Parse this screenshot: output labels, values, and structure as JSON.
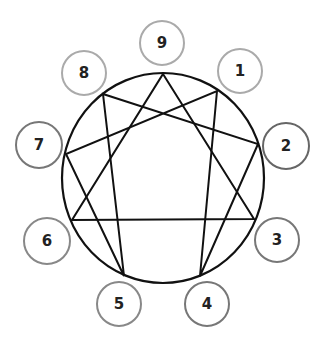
{
  "diagram": {
    "type": "enneagram",
    "main_circle": {
      "cx": 163,
      "cy": 178,
      "rx": 101,
      "ry": 105,
      "stroke": "#111111"
    },
    "nodes": [
      {
        "label": "9",
        "cx": 162,
        "cy": 43,
        "r": 22,
        "stroke": "#aaaaaa",
        "px": 163,
        "py": 74
      },
      {
        "label": "1",
        "cx": 240,
        "cy": 71,
        "r": 22,
        "stroke": "#aaaaaa",
        "px": 217,
        "py": 91
      },
      {
        "label": "2",
        "cx": 286,
        "cy": 146,
        "r": 23,
        "stroke": "#666666",
        "px": 258,
        "py": 144
      },
      {
        "label": "3",
        "cx": 277,
        "cy": 240,
        "r": 22,
        "stroke": "#777777",
        "px": 254,
        "py": 219
      },
      {
        "label": "4",
        "cx": 207,
        "cy": 304,
        "r": 22,
        "stroke": "#777777",
        "px": 200,
        "py": 276
      },
      {
        "label": "5",
        "cx": 119,
        "cy": 304,
        "r": 22,
        "stroke": "#888888",
        "px": 124,
        "py": 276
      },
      {
        "label": "6",
        "cx": 47,
        "cy": 241,
        "r": 23,
        "stroke": "#888888",
        "px": 72,
        "py": 220
      },
      {
        "label": "7",
        "cx": 39,
        "cy": 145,
        "r": 23,
        "stroke": "#777777",
        "px": 66,
        "py": 154
      },
      {
        "label": "8",
        "cx": 84,
        "cy": 73,
        "r": 22,
        "stroke": "#aaaaaa",
        "px": 103,
        "py": 94
      }
    ],
    "triangle": [
      "9",
      "3",
      "6"
    ],
    "hexad": [
      "1",
      "4",
      "2",
      "8",
      "5",
      "7"
    ]
  }
}
